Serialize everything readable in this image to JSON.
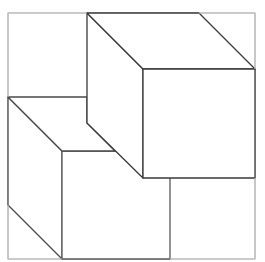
{
  "diagram": {
    "title": "",
    "colors": {
      "background": "#ffffff",
      "frame": "#bdbdbd",
      "cube_line": "#4a4a4a"
    },
    "frame": {
      "x1": 8,
      "y1": 13,
      "x2": 255,
      "y2": 259
    },
    "cubes": [
      {
        "name": "upper-right-cube",
        "top_face": [
          [
            87,
            13
          ],
          [
            199,
            13
          ],
          [
            255,
            69
          ],
          [
            143,
            69
          ]
        ],
        "front_face": [
          [
            143,
            69
          ],
          [
            255,
            69
          ],
          [
            255,
            178
          ],
          [
            143,
            178
          ]
        ],
        "left_face": [
          [
            87,
            13
          ],
          [
            143,
            69
          ],
          [
            143,
            178
          ],
          [
            87,
            123
          ]
        ]
      },
      {
        "name": "lower-left-cube",
        "top_face_visible": [
          [
            8,
            97
          ],
          [
            87,
            97
          ],
          [
            87,
            123
          ],
          [
            115,
            151
          ],
          [
            62,
            151
          ]
        ],
        "front_face": [
          [
            62,
            151
          ],
          [
            170,
            151
          ],
          [
            170,
            259
          ],
          [
            62,
            259
          ]
        ],
        "left_face": [
          [
            8,
            97
          ],
          [
            62,
            151
          ],
          [
            62,
            259
          ],
          [
            8,
            205
          ]
        ]
      }
    ]
  }
}
